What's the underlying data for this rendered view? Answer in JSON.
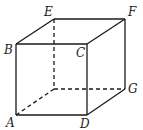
{
  "diagram": {
    "colors": {
      "line": "#1a1a1a",
      "label": "#222222",
      "background": "#ffffff"
    },
    "vertices": {
      "A": {
        "x": 16,
        "y": 115,
        "label": "A",
        "lx": 6,
        "ly": 127
      },
      "B": {
        "x": 16,
        "y": 44,
        "label": "B",
        "lx": 4,
        "ly": 54
      },
      "C": {
        "x": 87,
        "y": 44,
        "label": "C",
        "lx": 76,
        "ly": 57
      },
      "D": {
        "x": 87,
        "y": 115,
        "label": "D",
        "lx": 80,
        "ly": 128
      },
      "E": {
        "x": 54,
        "y": 19,
        "label": "E",
        "lx": 44,
        "ly": 16
      },
      "F": {
        "x": 125,
        "y": 19,
        "label": "F",
        "lx": 128,
        "ly": 16
      },
      "G": {
        "x": 125,
        "y": 89,
        "label": "G",
        "lx": 128,
        "ly": 93
      },
      "H": {
        "x": 54,
        "y": 89,
        "label": ""
      }
    },
    "solid_edges": [
      [
        "A",
        "B"
      ],
      [
        "B",
        "C"
      ],
      [
        "C",
        "D"
      ],
      [
        "D",
        "A"
      ],
      [
        "B",
        "E"
      ],
      [
        "E",
        "F"
      ],
      [
        "F",
        "C"
      ],
      [
        "F",
        "G"
      ],
      [
        "G",
        "D"
      ]
    ],
    "dashed_edges": [
      [
        "E",
        "H"
      ],
      [
        "H",
        "G"
      ],
      [
        "H",
        "A"
      ]
    ]
  }
}
